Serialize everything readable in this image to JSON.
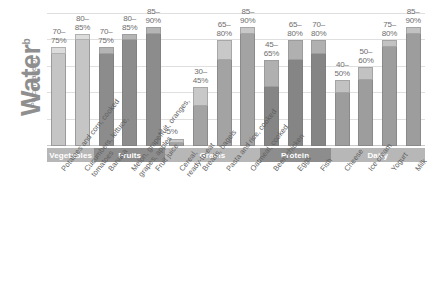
{
  "axis": {
    "y_title_main": "Water",
    "y_title_sup": "b",
    "y_title_prefix": "Percentage of"
  },
  "groups": [
    {
      "name": "Vegetables",
      "color": "#b4b4b4",
      "bar_indices": [
        0,
        1
      ]
    },
    {
      "name": "Fruits",
      "color": "#8b8b8b",
      "bar_indices": [
        2,
        3,
        4
      ]
    },
    {
      "name": "Grains",
      "color": "#a9a9a9",
      "bar_indices": [
        5,
        6,
        7,
        8
      ]
    },
    {
      "name": "Protein",
      "color": "#7f7f7f",
      "bar_indices": [
        9,
        10,
        11
      ]
    },
    {
      "name": "Dairy",
      "color": "#a0a0a0",
      "bar_indices": [
        12,
        13,
        14,
        15
      ]
    }
  ],
  "chart_data": {
    "type": "bar",
    "title": "",
    "xlabel": "",
    "ylabel": "Percentage of Water",
    "ylim": [
      0,
      100
    ],
    "grid": true,
    "legend": "none",
    "note": "Each bar is a range: the lower dark segment ends at the low value, the lighter cap extends to the high value.",
    "categories": [
      "Potatoes and corn, cooked",
      "Cucumbers, lettuce, tomatoes",
      "Banana",
      "Melon, grapefruit, oranges, grapes, apples",
      "Fruit juice",
      "Cereal, ready-to-eat",
      "Breads, bagels",
      "Pasta and rice, cooked",
      "Oatmeal, cooked",
      "Beef, chicken",
      "Eggs",
      "Fish",
      "Cheese",
      "Ice cream",
      "Yogurt",
      "Milk"
    ],
    "group_of": [
      "Vegetables",
      "Vegetables",
      "Fruits",
      "Fruits",
      "Fruits",
      "Grains",
      "Grains",
      "Grains",
      "Grains",
      "Protein",
      "Protein",
      "Protein",
      "Dairy",
      "Dairy",
      "Dairy",
      "Dairy"
    ],
    "low": [
      70,
      80,
      70,
      80,
      85,
      2,
      30,
      65,
      85,
      45,
      65,
      70,
      40,
      50,
      75,
      85
    ],
    "high": [
      75,
      85,
      75,
      85,
      90,
      5,
      45,
      80,
      90,
      65,
      80,
      80,
      50,
      60,
      80,
      90
    ],
    "value_labels": [
      "70–\n75%",
      "80–\n85%",
      "70–\n75%",
      "80–\n85%",
      "85–\n90%",
      "2–5%",
      "30–\n45%",
      "65–\n80%",
      "85–\n90%",
      "45–\n65%",
      "65–\n80%",
      "70–\n80%",
      "40–\n50%",
      "50–\n60%",
      "75–\n80%",
      "85–\n90%"
    ]
  },
  "bars": [
    {
      "id": "bar-potatoes-corn",
      "label_line1": "70–",
      "label_line2": "75%",
      "group": "Vegetables",
      "xlab1": "Potatoes and corn, cooked",
      "xlab2": ""
    },
    {
      "id": "bar-cucumbers",
      "label_line1": "80–",
      "label_line2": "85%",
      "group": "Vegetables",
      "xlab1": "Cucumbers, lettuce,",
      "xlab2": "tomatoes"
    },
    {
      "id": "bar-banana",
      "label_line1": "70–",
      "label_line2": "75%",
      "group": "Fruits",
      "xlab1": "Banana",
      "xlab2": ""
    },
    {
      "id": "bar-melon-citrus",
      "label_line1": "80–",
      "label_line2": "85%",
      "group": "Fruits",
      "xlab1": "Melon, grapefruit, oranges,",
      "xlab2": "grapes, apples"
    },
    {
      "id": "bar-fruit-juice",
      "label_line1": "85–",
      "label_line2": "90%",
      "group": "Fruits",
      "xlab1": "Fruit juice",
      "xlab2": ""
    },
    {
      "id": "bar-cereal",
      "label_line1": "2–5%",
      "label_line2": "",
      "group": "Grains",
      "xlab1": "Cereal,",
      "xlab2": "ready-to-eat"
    },
    {
      "id": "bar-breads-bagels",
      "label_line1": "30–",
      "label_line2": "45%",
      "group": "Grains",
      "xlab1": "Breads, bagels",
      "xlab2": ""
    },
    {
      "id": "bar-pasta-rice",
      "label_line1": "65–",
      "label_line2": "80%",
      "group": "Grains",
      "xlab1": "Pasta and rice, cooked",
      "xlab2": ""
    },
    {
      "id": "bar-oatmeal",
      "label_line1": "85–",
      "label_line2": "90%",
      "group": "Grains",
      "xlab1": "Oatmeal, cooked",
      "xlab2": ""
    },
    {
      "id": "bar-beef-chicken",
      "label_line1": "45–",
      "label_line2": "65%",
      "group": "Protein",
      "xlab1": "Beef, chicken",
      "xlab2": ""
    },
    {
      "id": "bar-eggs",
      "label_line1": "65–",
      "label_line2": "80%",
      "group": "Protein",
      "xlab1": "Eggs",
      "xlab2": ""
    },
    {
      "id": "bar-fish",
      "label_line1": "70–",
      "label_line2": "80%",
      "group": "Protein",
      "xlab1": "Fish",
      "xlab2": ""
    },
    {
      "id": "bar-cheese",
      "label_line1": "40–",
      "label_line2": "50%",
      "group": "Dairy",
      "xlab1": "Cheese",
      "xlab2": ""
    },
    {
      "id": "bar-ice-cream",
      "label_line1": "50–",
      "label_line2": "60%",
      "group": "Dairy",
      "xlab1": "Ice cream",
      "xlab2": ""
    },
    {
      "id": "bar-yogurt",
      "label_line1": "75–",
      "label_line2": "80%",
      "group": "Dairy",
      "xlab1": "Yogurt",
      "xlab2": ""
    },
    {
      "id": "bar-milk",
      "label_line1": "85–",
      "label_line2": "90%",
      "group": "Dairy",
      "xlab1": "Milk",
      "xlab2": ""
    }
  ],
  "colors": {
    "vegetables": "#c5c5c5",
    "vegetables_cap": "#dcdcdc",
    "fruits": "#8c8c8c",
    "fruits_cap": "#b5b5b5",
    "grains": "#a3a3a3",
    "grains_cap": "#c8c8c8",
    "protein": "#858585",
    "protein_cap": "#b0b0b0",
    "dairy": "#9d9d9d",
    "dairy_cap": "#c2c2c2",
    "band_light": "#b7b7b7",
    "band_dark": "#8d8d8d",
    "gridline": "#dfdfdf"
  }
}
